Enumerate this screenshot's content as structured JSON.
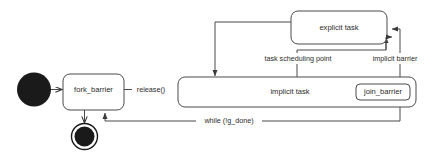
{
  "diagram": {
    "type": "uml-state-diagram",
    "title": "",
    "background_color": "#ffffff",
    "line_color": "#4a4a4a",
    "text_color": "#2b2b2b",
    "node_color": "#1a1a1a",
    "states": [
      {
        "id": "initial",
        "kind": "initial-state",
        "label": ""
      },
      {
        "id": "fork_barrier",
        "kind": "state",
        "label": "fork_barrier"
      },
      {
        "id": "final",
        "kind": "final-state",
        "label": ""
      },
      {
        "id": "implicit_task",
        "kind": "composite-state",
        "label": "implicit task"
      },
      {
        "id": "join_barrier",
        "kind": "state",
        "label": "join_barrier"
      },
      {
        "id": "explicit_task",
        "kind": "state",
        "label": "explicit task"
      }
    ],
    "transitions": [
      {
        "id": "t1",
        "from": "initial",
        "to": "fork_barrier",
        "label": ""
      },
      {
        "id": "t2",
        "from": "fork_barrier",
        "to": "implicit_task",
        "label": "release()"
      },
      {
        "id": "t3",
        "from": "fork_barrier",
        "to": "final",
        "label": ""
      },
      {
        "id": "t4",
        "from": "implicit_task",
        "to": "explicit_task",
        "label": "task scheduling point"
      },
      {
        "id": "t5",
        "from": "join_barrier",
        "to": "explicit_task",
        "label": "implicit barrier"
      },
      {
        "id": "t6",
        "from": "explicit_task",
        "to": "implicit_task",
        "label": ""
      },
      {
        "id": "t7",
        "from": "join_barrier",
        "to": "fork_barrier",
        "label": "while (!g_done)"
      }
    ]
  }
}
